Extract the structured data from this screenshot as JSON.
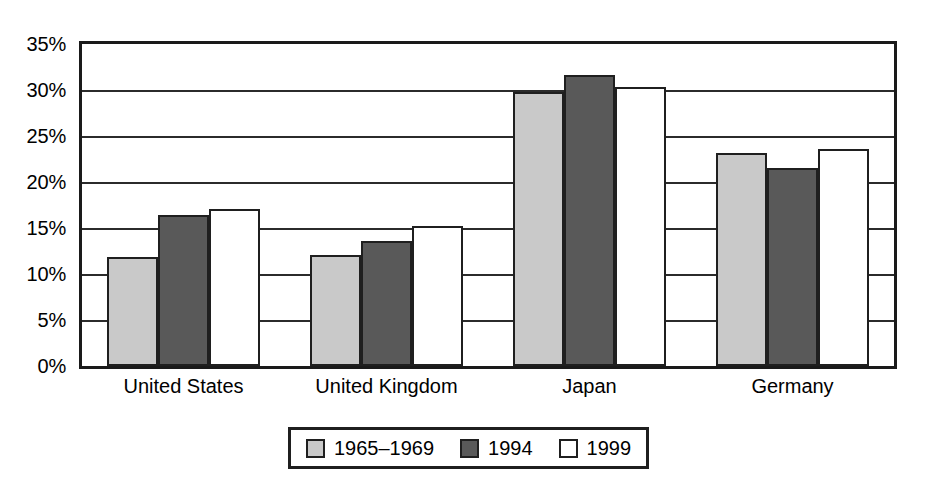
{
  "chart_data": {
    "type": "bar",
    "title": "",
    "subtitle": "",
    "xlabel": "",
    "ylabel": "",
    "ylim": [
      0,
      35
    ],
    "ytick_labels": [
      "0%",
      "5%",
      "10%",
      "15%",
      "20%",
      "25%",
      "30%",
      "35%"
    ],
    "ytick_values": [
      0,
      5,
      10,
      15,
      20,
      25,
      30,
      35
    ],
    "ytick_suffix": "%",
    "grid": true,
    "grid_axis": "y",
    "legend_position": "bottom",
    "categories": [
      "United States",
      "United Kingdom",
      "Japan",
      "Germany"
    ],
    "series": [
      {
        "name": "1965–1969",
        "color": "#c9c9c9",
        "values": [
          11.9,
          12.1,
          29.8,
          23.2
        ]
      },
      {
        "name": "1994",
        "color": "#595959",
        "values": [
          16.4,
          13.6,
          31.6,
          21.5
        ]
      },
      {
        "name": "1999",
        "color": "#ffffff",
        "values": [
          17.1,
          15.2,
          30.3,
          23.6
        ]
      }
    ]
  },
  "colors": {
    "series_1965_1969": "#c9c9c9",
    "series_1994": "#595959",
    "series_1999": "#ffffff",
    "axis_line": "#1a1a1a",
    "gridline": "#2b2b2b",
    "bar_outline": "#1f1f1f",
    "background": "#ffffff",
    "text": "#000000"
  }
}
